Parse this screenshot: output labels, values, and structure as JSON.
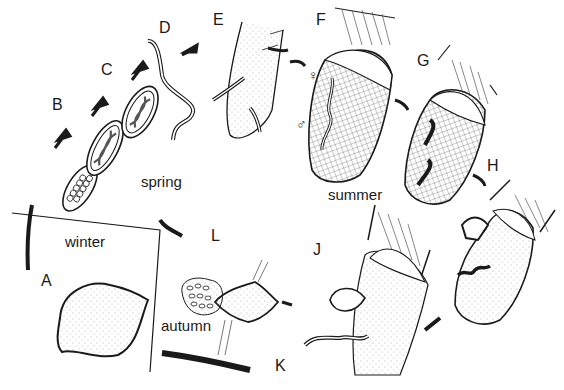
{
  "diagram": {
    "stage_labels": {
      "A": "A",
      "B": "B",
      "C": "C",
      "D": "D",
      "E": "E",
      "F": "F",
      "G": "G",
      "H": "H",
      "J": "J",
      "K": "K",
      "L": "L"
    },
    "seasons": {
      "spring": "spring",
      "summer": "summer",
      "autumn": "autumn",
      "winter": "winter"
    },
    "sex_symbols": {
      "female": "♀",
      "male": "♂"
    },
    "colors": {
      "ink": "#1a1a1a",
      "background": "#ffffff",
      "stipple": "#bdbdbd"
    }
  }
}
